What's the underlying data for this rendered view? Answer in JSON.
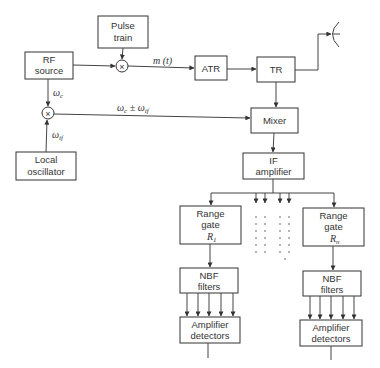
{
  "diagram": {
    "type": "block-diagram",
    "blocks": {
      "pulse_train": {
        "line1": "Pulse",
        "line2": "train"
      },
      "rf_source": {
        "line1": "RF",
        "line2": "source"
      },
      "atr": {
        "label": "ATR"
      },
      "tr": {
        "label": "TR"
      },
      "mixer": {
        "label": "Mixer"
      },
      "local_oscillator": {
        "line1": "Local",
        "line2": "oscillator"
      },
      "if_amplifier": {
        "line1": "IF",
        "line2": "amplifier"
      },
      "range_gate_1": {
        "line1": "Range",
        "line2": "gate",
        "line3": "R",
        "sub": "1"
      },
      "range_gate_n": {
        "line1": "Range",
        "line2": "gate",
        "line3": "R",
        "sub": "n"
      },
      "nbf_filters_1": {
        "line1": "NBF",
        "line2": "filters"
      },
      "nbf_filters_n": {
        "line1": "NBF",
        "line2": "filters"
      },
      "amp_detectors_1": {
        "line1": "Amplifier",
        "line2": "detectors"
      },
      "amp_detectors_n": {
        "line1": "Amplifier",
        "line2": "detectors"
      }
    },
    "multipliers": {
      "top": {
        "symbol": "×"
      },
      "bottom": {
        "symbol": "×"
      }
    },
    "signals": {
      "m_t": "m (t)",
      "omega_c": {
        "main": "ω",
        "sub": "c"
      },
      "omega_if": {
        "main": "ω",
        "sub": "if"
      },
      "omega_c_pm_if": {
        "main1": "ω",
        "sub1": "c",
        "pm": " ± ω",
        "sub2": "if"
      }
    },
    "antenna": {
      "icon": "dish-antenna"
    }
  }
}
